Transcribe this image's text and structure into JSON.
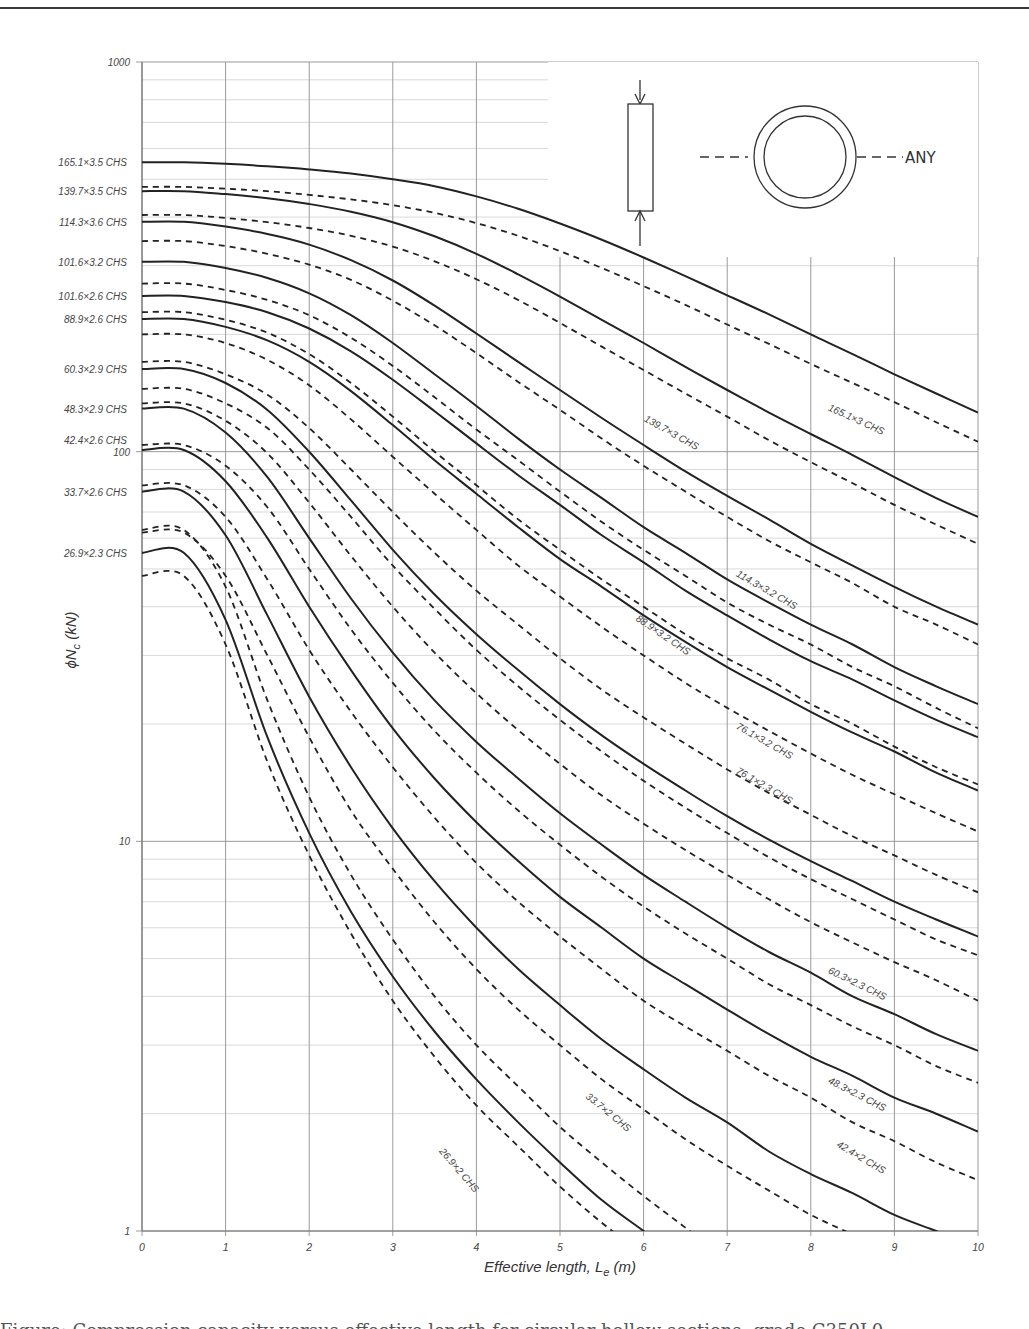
{
  "chart_data": {
    "type": "line",
    "title": "",
    "xlabel": "Effective length, L_e (m)",
    "xlabel_main": "Effective length, L",
    "xlabel_sub": "e",
    "xlabel_unit": " (m)",
    "ylabel": "ϕN_c (kN)",
    "ylabel_main": "ϕN",
    "ylabel_sub": "c",
    "ylabel_unit": "  (kN)",
    "yscale": "log",
    "xlim": [
      0,
      10
    ],
    "ylim": [
      1,
      1000
    ],
    "grid": true,
    "x_ticks": [
      "0",
      "1",
      "2",
      "3",
      "4",
      "5",
      "6",
      "7",
      "8",
      "9",
      "10"
    ],
    "y_ticks": [
      "1",
      "10",
      "100",
      "1000"
    ],
    "inset": {
      "label": "ANY",
      "description": "Axially loaded column with circular hollow section, buckling about any axis"
    },
    "x": [
      0,
      0.5,
      1,
      1.5,
      2,
      2.5,
      3,
      3.5,
      4,
      4.5,
      5,
      5.5,
      6,
      6.5,
      7,
      7.5,
      8,
      8.5,
      9,
      9.5,
      10
    ],
    "series": [
      {
        "name": "165.1×3.5 CHS",
        "style": "solid",
        "label_side": "left",
        "values": [
          553,
          553,
          548,
          540,
          530,
          517,
          500,
          480,
          452,
          420,
          385,
          350,
          315,
          282,
          252,
          225,
          200,
          178,
          158,
          141,
          126
        ]
      },
      {
        "name": "165.1×3 CHS",
        "style": "dashed",
        "label_side": "curve",
        "label_at": [
          8.2,
          128
        ],
        "values": [
          478,
          478,
          473,
          466,
          456,
          444,
          429,
          410,
          386,
          358,
          327,
          296,
          266,
          238,
          212,
          189,
          168,
          150,
          134,
          119,
          106
        ]
      },
      {
        "name": "139.7×3.5 CHS",
        "style": "solid",
        "label_side": "left",
        "values": [
          466,
          466,
          458,
          447,
          432,
          413,
          388,
          357,
          322,
          285,
          250,
          218,
          190,
          165,
          144,
          126,
          111,
          98,
          86,
          76,
          68
        ]
      },
      {
        "name": "139.7×3 CHS",
        "style": "dashed",
        "label_side": "curve",
        "label_at": [
          6.0,
          120
        ],
        "values": [
          405,
          405,
          398,
          388,
          375,
          358,
          336,
          308,
          277,
          245,
          214,
          186,
          162,
          141,
          123,
          107,
          94,
          83,
          73,
          65,
          58
        ]
      },
      {
        "name": "114.3×3.6 CHS",
        "style": "solid",
        "label_side": "left",
        "values": [
          389,
          389,
          378,
          362,
          340,
          310,
          275,
          237,
          201,
          170,
          144,
          122,
          104,
          89,
          77,
          67,
          58,
          51,
          45,
          40,
          36
        ]
      },
      {
        "name": "114.3×3.2 CHS",
        "style": "dashed",
        "label_side": "curve",
        "label_at": [
          7.1,
          48
        ],
        "values": [
          347,
          347,
          337,
          322,
          302,
          276,
          244,
          211,
          179,
          151,
          128,
          108,
          92,
          79,
          68,
          59,
          52,
          46,
          40,
          36,
          32
        ]
      },
      {
        "name": "101.6×3.2 CHS",
        "style": "solid",
        "label_side": "left",
        "values": [
          307,
          307,
          296,
          279,
          255,
          224,
          190,
          158,
          131,
          108,
          90,
          76,
          64,
          55,
          47,
          41,
          36,
          32,
          28,
          25,
          22.5
        ]
      },
      {
        "name": "101.6×2.6 CHS (dashed)",
        "style": "dashed",
        "label_side": "none",
        "values": [
          270,
          270,
          260,
          245,
          224,
          196,
          166,
          138,
          114,
          95,
          79,
          66,
          56,
          48,
          41,
          36,
          32,
          28,
          25,
          22,
          19.5
        ]
      },
      {
        "name": "101.6×2.6 CHS",
        "style": "solid",
        "label_side": "left",
        "values": [
          251,
          251,
          242,
          228,
          207,
          181,
          153,
          127,
          105,
          87,
          73,
          61,
          52,
          44,
          38,
          33,
          29,
          26,
          23,
          20.5,
          18.5
        ]
      },
      {
        "name": "88.9×2.6 CHS dashed-top",
        "style": "dashed",
        "label_side": "none",
        "values": [
          228,
          228,
          218,
          202,
          178,
          150,
          123,
          100,
          82,
          67,
          56,
          47,
          40,
          34,
          29.5,
          26,
          22.5,
          20,
          17.5,
          15.5,
          14
        ]
      },
      {
        "name": "88.9×2.6 CHS",
        "style": "solid",
        "label_side": "left",
        "values": [
          219,
          219,
          209,
          193,
          170,
          143,
          117,
          95,
          78,
          64,
          53,
          45,
          38,
          32.5,
          28,
          24.5,
          21.5,
          19,
          17,
          15,
          13.5
        ]
      },
      {
        "name": "88.9×3.2 CHS",
        "style": "dashed",
        "label_side": "curve",
        "label_at": [
          5.9,
          37
        ],
        "values": [
          200,
          200,
          190,
          172,
          148,
          121,
          97,
          78,
          63,
          51,
          42.5,
          35.5,
          30,
          25.5,
          22,
          19.2,
          16.8,
          14.8,
          13.2,
          11.8,
          10.6
        ]
      },
      {
        "name": "76.1×3.2 CHS",
        "style": "dashed",
        "label_side": "curve",
        "label_at": [
          7.1,
          19.5
        ],
        "values": [
          170,
          170,
          158,
          140,
          115,
          90,
          70,
          55,
          44,
          36,
          29.5,
          24.5,
          20.8,
          17.8,
          15.3,
          13.3,
          11.7,
          10.3,
          9.2,
          8.2,
          7.4
        ]
      },
      {
        "name": "60.3×2.9 CHS",
        "style": "solid",
        "label_side": "left",
        "values": [
          163,
          163,
          150,
          128,
          100,
          75,
          56,
          43,
          34,
          27.5,
          22.5,
          18.7,
          15.8,
          13.5,
          11.6,
          10.1,
          8.9,
          7.9,
          7.0,
          6.3,
          5.7
        ]
      },
      {
        "name": "76.1×2.3 CHS",
        "style": "dashed",
        "label_side": "curve",
        "label_at": [
          7.1,
          15
        ],
        "values": [
          145,
          145,
          133,
          115,
          90,
          68,
          51,
          39.5,
          31,
          25,
          20.5,
          17,
          14.3,
          12.2,
          10.5,
          9.1,
          8.0,
          7.1,
          6.3,
          5.6,
          5.1
        ]
      },
      {
        "name": "48.3×2.9 CHS",
        "style": "solid",
        "label_side": "left",
        "values": [
          129,
          129,
          112,
          86,
          60,
          42,
          30.5,
          23,
          18,
          14.5,
          11.8,
          9.8,
          8.2,
          7.0,
          6.0,
          5.2,
          4.6,
          4.0,
          3.6,
          3.2,
          2.9
        ]
      },
      {
        "name": "60.3×2.3 CHS",
        "style": "dashed",
        "label_side": "curve",
        "label_at": [
          8.2,
          4.6
        ],
        "values": [
          133,
          133,
          120,
          99,
          74,
          54,
          40,
          30.5,
          24,
          19.3,
          15.8,
          13.1,
          11.1,
          9.5,
          8.2,
          7.1,
          6.2,
          5.5,
          4.9,
          4.4,
          3.9
        ]
      },
      {
        "name": "42.4×2.6 CHS",
        "style": "solid",
        "label_side": "left",
        "values": [
          101,
          101,
          84,
          60,
          40,
          27.5,
          19.5,
          14.5,
          11.2,
          8.9,
          7.2,
          6.0,
          5.0,
          4.3,
          3.7,
          3.2,
          2.8,
          2.5,
          2.2,
          2.0,
          1.8
        ]
      },
      {
        "name": "48.3×2.3 CHS",
        "style": "dashed",
        "label_side": "curve",
        "label_at": [
          8.2,
          2.4
        ],
        "values": [
          104,
          104,
          92,
          72,
          50,
          35,
          25.5,
          19.2,
          15,
          12,
          9.8,
          8.1,
          6.8,
          5.8,
          5.0,
          4.3,
          3.8,
          3.35,
          3.0,
          2.65,
          2.4
        ]
      },
      {
        "name": "33.7×2.6 CHS",
        "style": "solid",
        "label_side": "left",
        "values": [
          79,
          79,
          61,
          38,
          23.5,
          15.5,
          10.8,
          7.9,
          6.0,
          4.7,
          3.8,
          3.1,
          2.6,
          2.2,
          1.9,
          1.6,
          1.4,
          1.25,
          1.1,
          1.0,
          null
        ]
      },
      {
        "name": "42.4×2 CHS",
        "style": "dashed",
        "label_side": "curve",
        "label_at": [
          8.3,
          1.65
        ],
        "values": [
          82,
          82,
          68,
          47,
          31,
          21.5,
          15.5,
          11.5,
          8.8,
          7.0,
          5.7,
          4.7,
          3.9,
          3.35,
          2.9,
          2.5,
          2.2,
          1.9,
          1.7,
          1.5,
          1.35
        ]
      },
      {
        "name": "33.7×2 CHS",
        "style": "dashed",
        "label_side": "curve",
        "label_at": [
          5.3,
          2.2
        ],
        "values": [
          62,
          62,
          48,
          30,
          18.5,
          12,
          8.5,
          6.2,
          4.7,
          3.7,
          3.0,
          2.45,
          2.05,
          1.72,
          1.47,
          1.27,
          1.1,
          0.98,
          null,
          null,
          null
        ]
      },
      {
        "name": "26.9×2.3 CHS",
        "style": "solid",
        "label_side": "left",
        "values": [
          55,
          55,
          37,
          18.5,
          10.5,
          6.6,
          4.5,
          3.25,
          2.45,
          1.9,
          1.5,
          1.2,
          1.0,
          null,
          null,
          null,
          null,
          null,
          null,
          null,
          null
        ]
      },
      {
        "name": "26.9×2 CHS",
        "style": "dashed",
        "label_side": "curve",
        "label_at": [
          3.55,
          1.6
        ],
        "values": [
          48,
          48,
          32,
          16,
          9.2,
          5.8,
          3.9,
          2.8,
          2.1,
          1.65,
          1.3,
          1.05,
          0.87,
          null,
          null,
          null,
          null,
          null,
          null,
          null,
          null
        ]
      },
      {
        "name": "unlabelled dashed (26.9 top)",
        "style": "dashed",
        "label_side": "none",
        "values": [
          63,
          63,
          45,
          23,
          13,
          8.2,
          5.6,
          4.0,
          3.0,
          2.35,
          1.85,
          1.5,
          1.23,
          1.02,
          null,
          null,
          null,
          null,
          null,
          null,
          null
        ]
      }
    ],
    "left_labels": [
      {
        "text": "165.1×3.5 CHS",
        "value": 553
      },
      {
        "text": "139.7×3.5 CHS",
        "value": 466
      },
      {
        "text": "114.3×3.6 CHS",
        "value": 389
      },
      {
        "text": "101.6×3.2 CHS",
        "value": 307
      },
      {
        "text": "101.6×2.6 CHS",
        "value": 251
      },
      {
        "text": "88.9×2.6 CHS",
        "value": 219
      },
      {
        "text": "60.3×2.9 CHS",
        "value": 163
      },
      {
        "text": "48.3×2.9 CHS",
        "value": 129
      },
      {
        "text": "42.4×2.6 CHS",
        "value": 107
      },
      {
        "text": "33.7×2.6 CHS",
        "value": 79
      },
      {
        "text": "26.9×2.3 CHS",
        "value": 55
      }
    ]
  },
  "page": {
    "bottom_text": "Figure: Compression capacity versus effective length for circular hollow sections, grade C350L0"
  }
}
